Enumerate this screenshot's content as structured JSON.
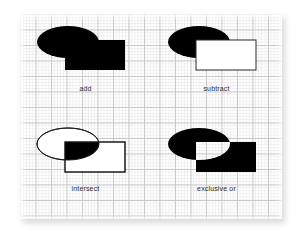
{
  "figure": {
    "background_color": "#ffffff",
    "panel": {
      "background_color": "#ffffff",
      "grid_minor_color": "#ededed",
      "grid_major_color": "#c9c9c9",
      "shadow_color": "#b9b9b9"
    },
    "fill_color": "#000000",
    "outline_color": "#000000",
    "empty_color": "#ffffff"
  },
  "operations": [
    {
      "id": "add",
      "label": "add",
      "description": "union of ellipse and rectangle, entirely filled black",
      "ellipse": {
        "cx": 48,
        "cy": 28,
        "rx": 31,
        "ry": 16
      },
      "rect": {
        "x": 45,
        "y": 26,
        "w": 60,
        "h": 30
      },
      "ellipse_style": "filled",
      "rect_style": "filled",
      "overlap_style": "filled"
    },
    {
      "id": "subtract",
      "label": "subtract",
      "description": "black ellipse with the rectangle region removed; rectangle drawn white with outline",
      "ellipse": {
        "cx": 48,
        "cy": 28,
        "rx": 31,
        "ry": 16
      },
      "rect": {
        "x": 45,
        "y": 26,
        "w": 60,
        "h": 30
      },
      "ellipse_style": "filled",
      "rect_style": "outlined-white",
      "overlap_style": "empty"
    },
    {
      "id": "intersect",
      "label": "intersect",
      "description": "outlined ellipse and outlined rectangle, only the shared lens region filled black",
      "ellipse": {
        "cx": 48,
        "cy": 28,
        "rx": 31,
        "ry": 16
      },
      "rect": {
        "x": 45,
        "y": 26,
        "w": 60,
        "h": 30
      },
      "ellipse_style": "outlined",
      "rect_style": "outlined",
      "overlap_style": "filled"
    },
    {
      "id": "exclusive-or",
      "label": "exclusive or",
      "description": "union of ellipse and rectangle filled black with the overlapping lens knocked out white",
      "ellipse": {
        "cx": 48,
        "cy": 28,
        "rx": 31,
        "ry": 16
      },
      "rect": {
        "x": 45,
        "y": 26,
        "w": 60,
        "h": 30
      },
      "ellipse_style": "filled",
      "rect_style": "filled",
      "overlap_style": "empty"
    }
  ]
}
